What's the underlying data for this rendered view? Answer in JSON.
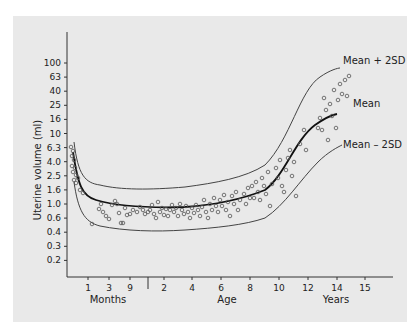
{
  "chart_data": {
    "type": "scatter",
    "title": "",
    "ylabel": "Uterine volume (ml)",
    "xlabel": "Age",
    "y_scale": "log",
    "y_ticks": [
      "100",
      "63",
      "40",
      "25",
      "16",
      "10",
      "6.3",
      "4.0",
      "2.5",
      "1.6",
      "1.0",
      "0.6",
      "0.4",
      "0.3",
      "0.2"
    ],
    "x_segments": [
      {
        "name": "Months",
        "ticks": [
          "1",
          "3",
          "9"
        ]
      },
      {
        "name": "Years",
        "ticks": [
          "2",
          "4",
          "6",
          "8",
          "10",
          "12",
          "14",
          "15"
        ]
      }
    ],
    "x_unit_labels": {
      "months": "Months",
      "age": "Age",
      "years": "Years"
    },
    "series": [
      {
        "name": "Mean + 2SD",
        "type": "line",
        "points": [
          [
            "birth",
            6.3
          ],
          [
            "1 mo",
            2.0
          ],
          [
            "3 mo",
            1.7
          ],
          [
            "9 mo",
            1.6
          ],
          [
            "2 y",
            1.6
          ],
          [
            "4 y",
            1.7
          ],
          [
            "6 y",
            2.0
          ],
          [
            "8 y",
            3.0
          ],
          [
            "10 y",
            6.0
          ],
          [
            "12 y",
            25
          ],
          [
            "14 y",
            60
          ]
        ]
      },
      {
        "name": "Mean",
        "type": "line",
        "points": [
          [
            "birth",
            4.5
          ],
          [
            "1 mo",
            1.3
          ],
          [
            "3 mo",
            1.0
          ],
          [
            "9 mo",
            0.9
          ],
          [
            "2 y",
            0.85
          ],
          [
            "4 y",
            0.9
          ],
          [
            "6 y",
            1.0
          ],
          [
            "8 y",
            1.3
          ],
          [
            "10 y",
            2.2
          ],
          [
            "12 y",
            6.0
          ],
          [
            "14 y",
            16
          ]
        ]
      },
      {
        "name": "Mean - 2SD",
        "type": "line",
        "points": [
          [
            "birth",
            1.8
          ],
          [
            "1 mo",
            0.6
          ],
          [
            "3 mo",
            0.5
          ],
          [
            "9 mo",
            0.45
          ],
          [
            "2 y",
            0.45
          ],
          [
            "4 y",
            0.5
          ],
          [
            "6 y",
            0.55
          ],
          [
            "8 y",
            0.65
          ],
          [
            "10 y",
            0.9
          ],
          [
            "12 y",
            2.0
          ],
          [
            "14 y",
            5.0
          ]
        ]
      },
      {
        "name": "Observations",
        "type": "scatter",
        "marker": "open-circle"
      }
    ],
    "annotations": [
      "Mean + 2SD",
      "Mean",
      "Mean – 2SD"
    ],
    "grid": false,
    "legend": "inline labels at right"
  },
  "labels": {
    "ylabel": "Uterine volume (ml)",
    "months": "Months",
    "age": "Age",
    "years": "Years",
    "mean_plus": "Mean + 2SD",
    "mean": "Mean",
    "mean_minus": "Mean – 2SD"
  }
}
